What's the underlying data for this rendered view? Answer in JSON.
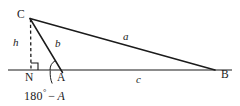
{
  "figure": {
    "type": "geometry-diagram",
    "background_color": "#ffffff",
    "stroke_color": "#1b1b1b",
    "canvas": {
      "width": 240,
      "height": 106
    }
  },
  "vertices": {
    "C": {
      "label": "C",
      "x": 30,
      "y": 18,
      "label_x": 18,
      "label_y": 9
    },
    "A": {
      "label": "A",
      "x": 61,
      "y": 70,
      "label_x": 58,
      "label_y": 73
    },
    "B": {
      "label": "B",
      "x": 215,
      "y": 70,
      "label_x": 221,
      "label_y": 70
    },
    "N": {
      "label": "N",
      "x": 31,
      "y": 70,
      "label_x": 26,
      "label_y": 73
    }
  },
  "sides": {
    "a": {
      "label": "a",
      "from": "C",
      "to": "B",
      "label_x": 124,
      "label_y": 33
    },
    "b": {
      "label": "b",
      "from": "C",
      "to": "A",
      "label_x": 56,
      "label_y": 40
    },
    "c": {
      "label": "c",
      "from": "A",
      "to": "B",
      "label_x": 136,
      "label_y": 74
    },
    "h": {
      "label": "h",
      "from": "C",
      "to": "N",
      "style": "dashed",
      "label_x": 14,
      "label_y": 38
    }
  },
  "marks": {
    "right_angle": {
      "name": "right-angle-mark",
      "at": "N",
      "size": 7
    },
    "angle_arc": {
      "name": "exterior-angle-arc",
      "at": "A",
      "radius": 11
    }
  },
  "annotations": {
    "exterior_angle": {
      "value_prefix": "180",
      "degree_symbol": "°",
      "operator": "−",
      "variable": "A",
      "full_text": "180° − A",
      "x": 24,
      "y": 87
    }
  },
  "baseline": {
    "name": "baseline",
    "x1": 8,
    "x2": 232,
    "y": 70
  }
}
